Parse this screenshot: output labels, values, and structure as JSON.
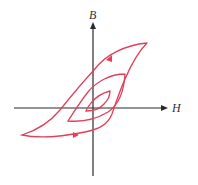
{
  "diagram": {
    "axes": {
      "x_label": "H",
      "y_label": "B"
    },
    "colors": {
      "axis": "#2a2a2a",
      "curve": "#e0405a"
    },
    "loops": [
      {
        "name": "outer-loop",
        "direction_markers": [
          "upper-branch-toward-left",
          "lower-branch-toward-right"
        ]
      },
      {
        "name": "middle-loop"
      },
      {
        "name": "inner-loop"
      }
    ]
  }
}
